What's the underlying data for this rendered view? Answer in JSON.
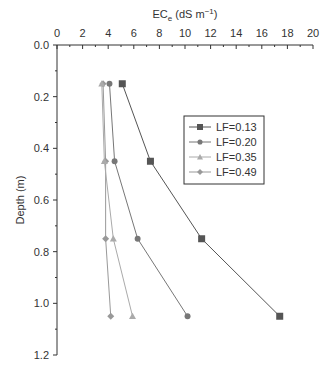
{
  "chart_data": {
    "type": "line",
    "title": "",
    "xlabel": "EC",
    "xlabel_sub": "e",
    "xlabel_unit": " (dS m",
    "xlabel_sup": "−1",
    "xlabel_close": ")",
    "ylabel": "Depth (m)",
    "xlim": [
      0,
      20
    ],
    "ylim": [
      0.0,
      1.2
    ],
    "y_inverted": true,
    "x_axis_position": "top",
    "x_ticks": [
      "0",
      "2",
      "4",
      "6",
      "8",
      "10",
      "12",
      "14",
      "16",
      "18",
      "20"
    ],
    "y_ticks": [
      "0.0",
      "0.2",
      "0.4",
      "0.6",
      "0.8",
      "1.0",
      "1.2"
    ],
    "grid": false,
    "legend_position": "upper-right-inside",
    "y": [
      0.15,
      0.45,
      0.75,
      1.05
    ],
    "series": [
      {
        "name": "LF=0.13",
        "marker": "square",
        "color": "#555555",
        "values": [
          5.1,
          7.3,
          11.3,
          17.4
        ]
      },
      {
        "name": "LF=0.20",
        "marker": "circle",
        "color": "#777777",
        "values": [
          4.1,
          4.5,
          6.3,
          10.2
        ]
      },
      {
        "name": "LF=0.35",
        "marker": "triangle",
        "color": "#aaaaaa",
        "values": [
          3.5,
          3.7,
          4.4,
          5.9
        ]
      },
      {
        "name": "LF=0.49",
        "marker": "diamond",
        "color": "#999999",
        "values": [
          3.6,
          3.8,
          3.8,
          4.2
        ]
      }
    ]
  }
}
